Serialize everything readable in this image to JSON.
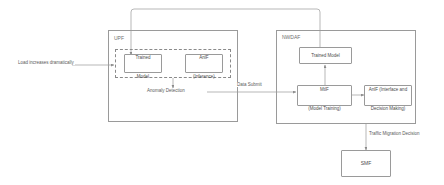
{
  "diagram": {
    "type": "flow-diagram",
    "colors": {
      "stroke": "#9a9a9a",
      "dashed_stroke": "#8a8a8a",
      "text": "#4a4a4a",
      "label_text": "#5a5a5a",
      "background": "#ffffff"
    },
    "containers": [
      {
        "id": "upf",
        "label": "UPF"
      },
      {
        "id": "nwdaf",
        "label": "NWDAF"
      }
    ],
    "nodes": [
      {
        "id": "upf_trained_model",
        "label": "Trained\nModel",
        "line1": "Trained",
        "line2": "Model"
      },
      {
        "id": "upf_anlf",
        "label": "AnlF\n(Inference)",
        "line1": "AnlF",
        "line2": "(Inference)"
      },
      {
        "id": "nwdaf_trained_model",
        "label": "Trained Model",
        "line1": "Trained Model",
        "line2": ""
      },
      {
        "id": "nwdaf_mtlf",
        "label": "MtlF\n(Model Training)",
        "line1": "MtlF",
        "line2": "(Model Training)"
      },
      {
        "id": "nwdaf_anlf",
        "label": "AnlF  (Interface and\nDecision Making)",
        "line1": "AnlF  (Interface and",
        "line2": "Decision Making)"
      },
      {
        "id": "smf",
        "label": "SMF",
        "line1": "SMF",
        "line2": ""
      }
    ],
    "edge_labels": [
      {
        "id": "load_increase",
        "text": "Load increases dramatically"
      },
      {
        "id": "anomaly_detection",
        "text": "Anomaly Detection"
      },
      {
        "id": "data_submit",
        "text": "Data Submit"
      },
      {
        "id": "traffic_migration",
        "text": "Traffic Migration Decision"
      }
    ]
  }
}
